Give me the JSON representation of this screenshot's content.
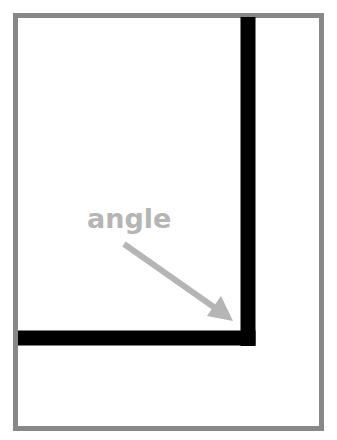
{
  "diagram": {
    "title": "",
    "frame": {
      "stroke_color": "#888888",
      "x": 15,
      "y": 15,
      "width": 307,
      "height": 414,
      "stroke_width": 5
    },
    "corner_lines": {
      "color": "#000000",
      "thickness": 15,
      "vertical": {
        "x": 248,
        "y1": 16,
        "y2": 346
      },
      "horizontal": {
        "y": 338,
        "x1": 18,
        "x2": 256
      }
    },
    "label": {
      "text": "angle",
      "color": "#b5b5b5",
      "x": 87,
      "y": 228,
      "font_size": 26
    },
    "arrow": {
      "color": "#b5b5b5",
      "x1": 124,
      "y1": 244,
      "x2": 233,
      "y2": 320,
      "stroke_width": 6
    }
  }
}
